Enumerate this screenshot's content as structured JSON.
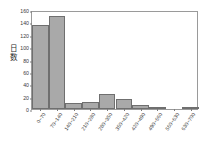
{
  "chart_data": {
    "type": "bar",
    "title": "",
    "subtitle": "",
    "xlabel": "",
    "ylabel": "日数",
    "ylabel_chars": [
      "日",
      "数"
    ],
    "categories": [
      "0~70",
      "70~140",
      "140~210",
      "210~280",
      "280~350",
      "350~420",
      "420~490",
      "490~560",
      "560~630",
      "630~700"
    ],
    "values": [
      136,
      150,
      9,
      11,
      25,
      16,
      6,
      3,
      0,
      1
    ],
    "ylim": [
      0,
      160
    ],
    "yticks": [
      0,
      20,
      40,
      60,
      80,
      100,
      120,
      140,
      160
    ],
    "ytick_labels": [
      "0",
      "20",
      "40",
      "60",
      "80",
      "100",
      "120",
      "140",
      "160"
    ],
    "grid": false,
    "legend": null,
    "bar_color": "#a9a9a9",
    "bar_edge_color": "#6f6f6f",
    "frame_color": "#9a9a9a",
    "text_color": "#3a3a3a",
    "background": "#ffffff"
  }
}
